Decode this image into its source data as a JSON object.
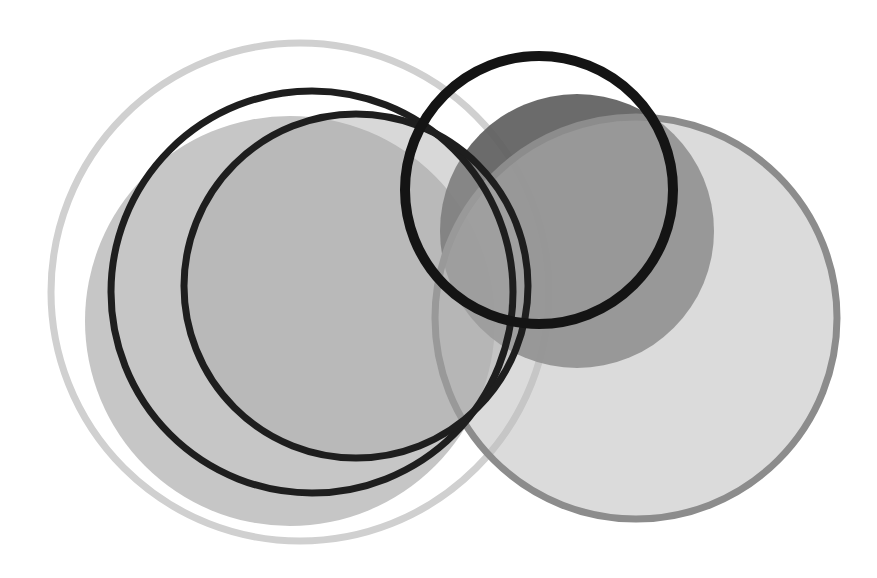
{
  "artwork": {
    "background": "#ffffff",
    "shapes": [
      {
        "id": "outer-light-ring",
        "type": "ring",
        "cx": 300,
        "cy": 292,
        "r": 249,
        "stroke": "#d0d0d0",
        "stroke_width": 7,
        "fill": "none"
      },
      {
        "id": "left-light-disc",
        "type": "disc",
        "cx": 290,
        "cy": 321,
        "r": 205,
        "fill": "#c6c6c6",
        "opacity": 1
      },
      {
        "id": "right-dark-disc",
        "type": "disc",
        "cx": 577,
        "cy": 231,
        "r": 137,
        "fill": "#5e5e5e",
        "opacity": 0.92
      },
      {
        "id": "right-large-disc",
        "type": "ring-filled",
        "cx": 636,
        "cy": 318,
        "r": 201,
        "fill": "#bdbdbd",
        "fill_opacity": 0.55,
        "stroke": "#8c8c8c",
        "stroke_width": 7
      },
      {
        "id": "inner-mid-disc",
        "type": "disc",
        "cx": 356,
        "cy": 286,
        "r": 172,
        "fill": "#a9a9a9",
        "opacity": 0.45
      },
      {
        "id": "black-ring-left",
        "type": "ring",
        "cx": 312,
        "cy": 292,
        "r": 201,
        "stroke": "#1e1e1e",
        "stroke_width": 7,
        "fill": "none"
      },
      {
        "id": "black-ring-inner",
        "type": "ring",
        "cx": 356,
        "cy": 286,
        "r": 172,
        "stroke": "#1e1e1e",
        "stroke_width": 7,
        "fill": "none"
      },
      {
        "id": "black-ring-top",
        "type": "ring",
        "cx": 539,
        "cy": 190,
        "r": 134,
        "stroke": "#141414",
        "stroke_width": 10,
        "fill": "none"
      }
    ]
  }
}
